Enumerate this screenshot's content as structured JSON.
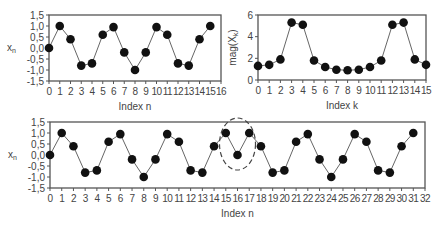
{
  "colors": {
    "frame": "#555555",
    "line": "#666666",
    "marker": "#111111",
    "text": "#444444",
    "ellipse": "#444444"
  },
  "chart_data": [
    {
      "id": "top-left",
      "type": "line",
      "title": "",
      "xlabel": "Index n",
      "ylabel": "x",
      "ylabel_sub": "n",
      "xlim": [
        0,
        16
      ],
      "ylim": [
        -1.5,
        1.5
      ],
      "xticks": [
        "0",
        "1",
        "2",
        "3",
        "4",
        "5",
        "6",
        "7",
        "8",
        "9",
        "10",
        "11",
        "12",
        "13",
        "14",
        "15",
        "16"
      ],
      "yticks": [
        "1,5",
        "1,0",
        "0,5",
        "0,0",
        "-0,5",
        "-1,0",
        "-1,5"
      ],
      "ytick_values": [
        1.5,
        1.0,
        0.5,
        0.0,
        -0.5,
        -1.0,
        -1.5
      ],
      "grid": false,
      "x": [
        0,
        1,
        2,
        3,
        4,
        5,
        6,
        7,
        8,
        9,
        10,
        11,
        12,
        13,
        14,
        15
      ],
      "values": [
        0.0,
        1.0,
        0.4,
        -0.8,
        -0.7,
        0.6,
        0.95,
        -0.2,
        -1.0,
        -0.2,
        0.95,
        0.6,
        -0.7,
        -0.8,
        0.4,
        1.0
      ],
      "box": {
        "x0": 49,
        "x1": 221,
        "y0": 15,
        "y1": 81
      }
    },
    {
      "id": "top-right",
      "type": "line",
      "title": "",
      "xlabel": "Index k",
      "ylabel": "mag(X",
      "ylabel_sub": "k",
      "ylabel_tail": ")",
      "xlim": [
        0,
        15
      ],
      "ylim": [
        0,
        6
      ],
      "xticks": [
        "0",
        "1",
        "2",
        "3",
        "4",
        "5",
        "6",
        "7",
        "8",
        "9",
        "10",
        "11",
        "12",
        "13",
        "14",
        "15"
      ],
      "yticks": [
        "6",
        "4",
        "2",
        "0"
      ],
      "ytick_values": [
        6,
        4,
        2,
        0
      ],
      "grid": false,
      "x": [
        0,
        1,
        2,
        3,
        4,
        5,
        6,
        7,
        8,
        9,
        10,
        11,
        12,
        13,
        14,
        15
      ],
      "values": [
        1.3,
        1.4,
        1.9,
        5.3,
        5.1,
        1.8,
        1.2,
        0.95,
        0.9,
        0.95,
        1.2,
        1.8,
        5.1,
        5.3,
        1.9,
        1.4
      ],
      "box": {
        "x0": 258,
        "x1": 426,
        "y0": 15,
        "y1": 80
      }
    },
    {
      "id": "bottom",
      "type": "line",
      "title": "",
      "xlabel": "Index n",
      "ylabel": "x",
      "ylabel_sub": "n",
      "xlim": [
        0,
        32
      ],
      "ylim": [
        -1.5,
        1.5
      ],
      "xticks": [
        "0",
        "1",
        "2",
        "3",
        "4",
        "5",
        "6",
        "7",
        "8",
        "9",
        "10",
        "11",
        "12",
        "13",
        "14",
        "15",
        "16",
        "17",
        "18",
        "19",
        "20",
        "21",
        "22",
        "23",
        "24",
        "25",
        "26",
        "27",
        "28",
        "29",
        "30",
        "31",
        "32"
      ],
      "yticks": [
        "1,5",
        "1,0",
        "0,5",
        "0,0",
        "-0,5",
        "-1,0",
        "-1,5"
      ],
      "ytick_values": [
        1.5,
        1.0,
        0.5,
        0.0,
        -0.5,
        -1.0,
        -1.5
      ],
      "grid": false,
      "x": [
        0,
        1,
        2,
        3,
        4,
        5,
        6,
        7,
        8,
        9,
        10,
        11,
        12,
        13,
        14,
        15,
        16,
        17,
        18,
        19,
        20,
        21,
        22,
        23,
        24,
        25,
        26,
        27,
        28,
        29,
        30,
        31
      ],
      "values": [
        0.0,
        1.0,
        0.4,
        -0.8,
        -0.7,
        0.6,
        0.95,
        -0.2,
        -1.0,
        -0.2,
        0.95,
        0.6,
        -0.7,
        -0.8,
        0.4,
        1.0,
        0.0,
        1.0,
        0.4,
        -0.8,
        -0.7,
        0.6,
        0.95,
        -0.2,
        -1.0,
        -0.2,
        0.95,
        0.6,
        -0.7,
        -0.8,
        0.4,
        1.0
      ],
      "annotations": [
        {
          "type": "dashed-ellipse",
          "label": "discontinuity at period boundary",
          "center_x": 16,
          "center_y": 0.5,
          "rx_px": 18,
          "ry_px": 26
        }
      ],
      "box": {
        "x0": 50,
        "x1": 425,
        "y0": 122,
        "y1": 188
      }
    }
  ]
}
